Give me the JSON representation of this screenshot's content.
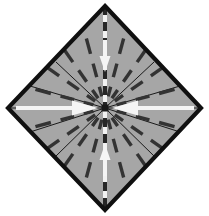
{
  "figure": {
    "background_color": "#ffffff",
    "width": 209,
    "height": 216
  },
  "shape": {
    "name": "diamond",
    "fill_color": "#a6a6a6",
    "border_color": "#101010",
    "border_width": 4.2,
    "vertices": {
      "top": [
        105,
        6
      ],
      "right": [
        201,
        108
      ],
      "bottom": [
        105,
        210
      ],
      "left": [
        8,
        108
      ]
    }
  },
  "center": {
    "label": "center-node",
    "x": 105,
    "y": 108,
    "size": 7,
    "color": "#1a1a1a"
  },
  "wedge_lines": {
    "name": "thin-radial-wedge-lines",
    "color": "#1a1a1a",
    "width": 1.0,
    "endpoints": [
      [
        8,
        108
      ],
      [
        201,
        108
      ],
      [
        56,
        62
      ],
      [
        56,
        156
      ],
      [
        154,
        62
      ],
      [
        154,
        156
      ],
      [
        30,
        86
      ],
      [
        30,
        132
      ],
      [
        180,
        86
      ],
      [
        180,
        132
      ]
    ]
  },
  "radial_dashes": {
    "name": "radial-dash-ticks",
    "color": "#333333",
    "width": 3.4,
    "angles_deg": [
      15,
      35,
      55,
      75,
      105,
      125,
      145,
      165,
      195,
      215,
      235,
      255,
      285,
      305,
      325,
      345
    ],
    "rings": [
      {
        "inner": 12,
        "outer": 22
      },
      {
        "inner": 32,
        "outer": 46
      },
      {
        "inner": 56,
        "outer": 72
      }
    ]
  },
  "axis": {
    "name": "vertical-dashed-axis",
    "orientation": "vertical",
    "x": 105,
    "top": 6,
    "bottom": 210,
    "dark_color": "#262626",
    "light_color": "#f2f2f2",
    "width": 4.0,
    "dash_pattern": "9 7"
  },
  "arrows": [
    {
      "name": "arrow-left-inward",
      "direction": "right",
      "color": "#f5f5f5",
      "from": [
        16,
        108
      ],
      "to": [
        98,
        108
      ],
      "shaft_width": 4.0,
      "head_length": 26,
      "head_width": 15
    },
    {
      "name": "arrow-right-inward",
      "direction": "left",
      "color": "#f5f5f5",
      "from": [
        194,
        108
      ],
      "to": [
        112,
        108
      ],
      "shaft_width": 4.0,
      "head_length": 26,
      "head_width": 15
    },
    {
      "name": "arrow-top-inward",
      "direction": "down",
      "color": "#f5f5f5",
      "from": [
        105,
        40
      ],
      "to": [
        105,
        72
      ],
      "shaft_width": 4.0,
      "head_length": 16,
      "head_width": 11
    },
    {
      "name": "arrow-bottom-inward",
      "direction": "up",
      "color": "#f5f5f5",
      "from": [
        105,
        176
      ],
      "to": [
        105,
        144
      ],
      "shaft_width": 4.0,
      "head_length": 16,
      "head_width": 11
    }
  ]
}
